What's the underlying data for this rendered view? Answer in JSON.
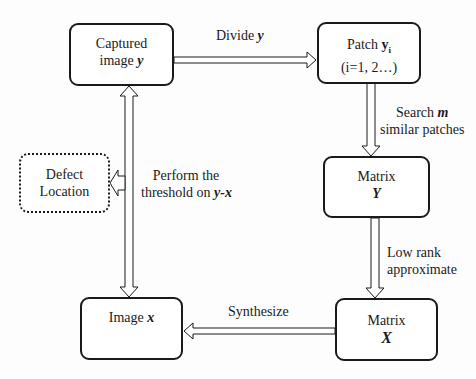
{
  "diagram": {
    "nodes": {
      "captured": {
        "line1": "Captured",
        "line2_prefix": "image ",
        "line2_var": "y"
      },
      "patch": {
        "line1_prefix": "Patch ",
        "line1_var": "y",
        "line1_sub": "i",
        "line2": "(i=1, 2…)"
      },
      "matrix_y": {
        "line1": "Matrix",
        "line2_var": "Y"
      },
      "matrix_x": {
        "line1": "Matrix",
        "line2_var": "X"
      },
      "image_x": {
        "line1_prefix": "Image ",
        "line1_var": "x"
      },
      "defect": {
        "line1": "Defect",
        "line2": "Location",
        "style": "dotted"
      }
    },
    "edges": {
      "divide": {
        "prefix": "Divide ",
        "var": "y",
        "from": "captured",
        "to": "patch"
      },
      "search": {
        "line1_prefix": "Search ",
        "line1_var": "m",
        "line2": "similar patches",
        "from": "patch",
        "to": "matrix_y"
      },
      "low_rank": {
        "line1": "Low rank",
        "line2": "approximate",
        "from": "matrix_y",
        "to": "matrix_x"
      },
      "synthesize": {
        "label": "Synthesize",
        "from": "matrix_x",
        "to": "image_x"
      },
      "threshold": {
        "line1": "Perform the",
        "line2_prefix": "threshold on ",
        "line2_var": "y-x",
        "between": [
          "captured",
          "image_x"
        ],
        "bidirectional": true
      },
      "to_defect": {
        "from": "threshold",
        "to": "defect"
      }
    },
    "colors": {
      "stroke": "#1a1a1a",
      "fill": "#ffffff",
      "background": "#fdfdfd"
    }
  }
}
